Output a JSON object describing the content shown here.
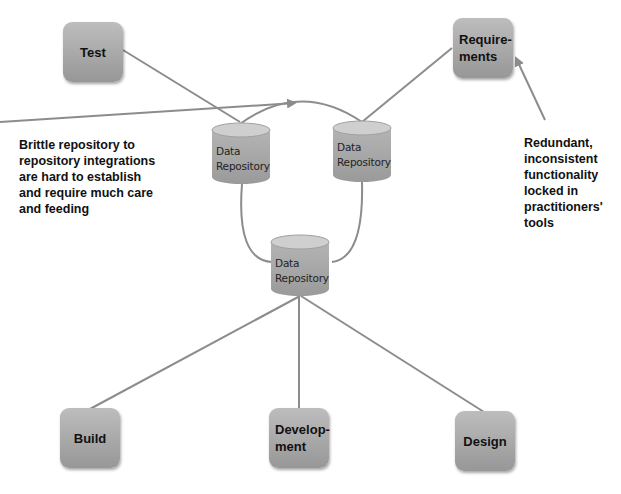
{
  "diagram": {
    "tools": {
      "test": "Test",
      "requirements": "Requirements",
      "requirements_display": "Require-\nments",
      "build": "Build",
      "development": "Development",
      "development_display": "Develop-\nment",
      "design": "Design"
    },
    "repositories": [
      {
        "id": "repo-left",
        "label": "Data\nRepository"
      },
      {
        "id": "repo-right",
        "label": "Data\nRepository"
      },
      {
        "id": "repo-bottom",
        "label": "Data\nRepository"
      }
    ],
    "annotations": {
      "left": "Brittle repository to\nrepository integrations\nare hard to establish\nand require much care\nand feeding",
      "right": "Redundant,\ninconsistent\nfunctionality\nlocked in\npractitioners'\ntools"
    },
    "colors": {
      "box_fill": "#a8a8a8",
      "line": "#8c8c8c",
      "text": "#111111",
      "background": "#ffffff"
    }
  }
}
